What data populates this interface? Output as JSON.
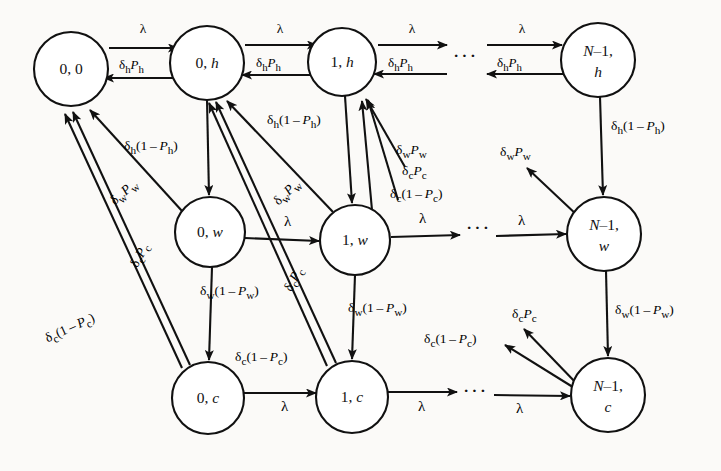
{
  "figure": {
    "type": "markov-chain-state-transition-diagram",
    "title": "",
    "background_color": "#fbfaf8",
    "ink_color": "#111111"
  },
  "symbols": {
    "lambda": "λ",
    "delta": "δ",
    "ellipsis": "···",
    "minus": "–"
  },
  "rates": {
    "arrival": "λ",
    "h_success": "δhPh",
    "h_fail": "δh(1−Ph)",
    "w_success": "δwPw",
    "w_fail": "δw(1−Pw)",
    "c_success": "δcPc",
    "c_fail": "δc(1−Pc)"
  },
  "nodes": [
    {
      "id": "n00",
      "line1": "0, 0",
      "line2": "",
      "cx": 71,
      "cy": 69,
      "r": 37,
      "row": "h",
      "col": 0
    },
    {
      "id": "n0h",
      "line1": "0, h",
      "line2": "",
      "cx": 207,
      "cy": 63,
      "r": 37,
      "row": "h",
      "col": 1
    },
    {
      "id": "n1h",
      "line1": "1, h",
      "line2": "",
      "cx": 342,
      "cy": 62,
      "r": 34,
      "row": "h",
      "col": 2
    },
    {
      "id": "nNh",
      "line1": "N–1,",
      "line2": "h",
      "cx": 598,
      "cy": 60,
      "r": 37,
      "row": "h",
      "col": 3
    },
    {
      "id": "n0w",
      "line1": "0, w",
      "line2": "",
      "cx": 210,
      "cy": 232,
      "r": 35,
      "row": "w",
      "col": 1
    },
    {
      "id": "n1w",
      "line1": "1, w",
      "line2": "",
      "cx": 355,
      "cy": 240,
      "r": 35,
      "row": "w",
      "col": 2
    },
    {
      "id": "nNw",
      "line1": "N–1,",
      "line2": "w",
      "cx": 604,
      "cy": 234,
      "r": 37,
      "row": "w",
      "col": 3
    },
    {
      "id": "n0c",
      "line1": "0, c",
      "line2": "",
      "cx": 208,
      "cy": 398,
      "r": 36,
      "row": "c",
      "col": 1
    },
    {
      "id": "n1c",
      "line1": "1, c",
      "line2": "",
      "cx": 352,
      "cy": 397,
      "r": 36,
      "row": "c",
      "col": 2
    },
    {
      "id": "nNc",
      "line1": "N–1,",
      "line2": "c",
      "cx": 608,
      "cy": 395,
      "r": 37,
      "row": "c",
      "col": 3
    }
  ],
  "ellipses": [
    {
      "id": "dots-h",
      "x": 465,
      "y": 58,
      "text": "···"
    },
    {
      "id": "dots-w",
      "x": 478,
      "y": 230,
      "text": "···"
    },
    {
      "id": "dots-c",
      "x": 475,
      "y": 393,
      "text": "···"
    }
  ],
  "edges": [
    {
      "id": "e1",
      "from": "0, 0",
      "to": "0, h",
      "label": "λ",
      "lx": 143,
      "ly": 32
    },
    {
      "id": "e2",
      "from": "0, h",
      "to": "0, 0",
      "label": "δhPh",
      "lx": 143,
      "ly": 66
    },
    {
      "id": "e3",
      "from": "0, h",
      "to": "1, h",
      "label": "λ",
      "lx": 280,
      "ly": 32
    },
    {
      "id": "e4",
      "from": "1, h",
      "to": "0, h",
      "label": "δhPh",
      "lx": 280,
      "ly": 66
    },
    {
      "id": "e5",
      "from": "1, h",
      "to": "···",
      "label": "λ",
      "lx": 412,
      "ly": 32
    },
    {
      "id": "e6",
      "from": "···",
      "to": "1, h",
      "label": "δhPh",
      "lx": 412,
      "ly": 66
    },
    {
      "id": "e7",
      "from": "···",
      "to": "N–1, h",
      "label": "λ",
      "lx": 517,
      "ly": 32
    },
    {
      "id": "e8",
      "from": "N–1, h",
      "to": "···",
      "label": "δhPh",
      "lx": 517,
      "ly": 66
    },
    {
      "id": "e9",
      "from": "0, h",
      "to": "0, w",
      "label": "δh(1−Ph)",
      "lx": 165,
      "ly": 148
    },
    {
      "id": "e10",
      "from": "1, h",
      "to": "1, w",
      "label": "δh(1−Ph)",
      "lx": 312,
      "ly": 122
    },
    {
      "id": "e11",
      "from": "N–1, h",
      "to": "N–1, w",
      "label": "δh(1−Ph)",
      "lx": 652,
      "ly": 128
    },
    {
      "id": "e12",
      "from": "0, w",
      "to": "0, 0",
      "label": "δwPw",
      "lx": 131,
      "ly": 193
    },
    {
      "id": "e13",
      "from": "1, w",
      "to": "0, h",
      "label": "δwPw",
      "lx": 295,
      "ly": 193
    },
    {
      "id": "e14",
      "from": "N–1, w",
      "to": "···",
      "label": "δwPw",
      "lx": 523,
      "ly": 152
    },
    {
      "id": "e15",
      "from": "0, w",
      "to": "1, w",
      "label": "λ",
      "lx": 290,
      "ly": 225
    },
    {
      "id": "e16",
      "from": "1, w",
      "to": "···",
      "label": "λ",
      "lx": 425,
      "ly": 222
    },
    {
      "id": "e17",
      "from": "···",
      "to": "N–1, w",
      "label": "λ",
      "lx": 524,
      "ly": 226
    },
    {
      "id": "e18",
      "from": "0, w",
      "to": "0, c",
      "label": "δw(1−Pw)",
      "lx": 247,
      "ly": 292
    },
    {
      "id": "e19",
      "from": "1, w",
      "to": "1, c",
      "label": "δw(1−Pw)",
      "lx": 394,
      "ly": 308
    },
    {
      "id": "e20",
      "from": "N–1, w",
      "to": "N–1, c",
      "label": "δw(1−Pw)",
      "lx": 658,
      "ly": 312
    },
    {
      "id": "e21",
      "from": "0, c",
      "to": "0, 0",
      "label": "δcPc",
      "lx": 152,
      "ly": 256
    },
    {
      "id": "e22",
      "from": "0, c",
      "to": "0, 0",
      "label": "δc(1−Pc)",
      "lx": 92,
      "ly": 330
    },
    {
      "id": "e23",
      "from": "1, c",
      "to": "0, h",
      "label": "δcPc",
      "lx": 305,
      "ly": 281
    },
    {
      "id": "e24",
      "from": "1, c",
      "to": "1, h",
      "label": "δc(1−Pc)",
      "lx": 404,
      "ly": 172
    },
    {
      "id": "e25",
      "from": "1, c",
      "to": "1, h",
      "label": "δcPc",
      "lx": 403,
      "ly": 151
    },
    {
      "id": "e26",
      "from": "N–1, c",
      "to": "···",
      "label": "δcPc",
      "lx": 538,
      "ly": 318
    },
    {
      "id": "e27",
      "from": "N–1, c",
      "to": "···",
      "label": "δc(1−Pc)",
      "lx": 477,
      "ly": 343
    },
    {
      "id": "e28",
      "from": "0, c",
      "to": "1, c",
      "label": "λ",
      "lx": 287,
      "ly": 410
    },
    {
      "id": "e29",
      "from": "1, c",
      "to": "···",
      "label": "λ",
      "lx": 424,
      "ly": 410
    },
    {
      "id": "e30",
      "from": "···",
      "to": "N–1, c",
      "label": "λ",
      "lx": 522,
      "ly": 410
    },
    {
      "id": "e31",
      "from": "0, h",
      "to": "1, c-ref",
      "label": "δc(1−Pc)",
      "lx": 296,
      "ly": 358
    }
  ],
  "ghost_text": {
    "top": "",
    "bottom": ""
  }
}
